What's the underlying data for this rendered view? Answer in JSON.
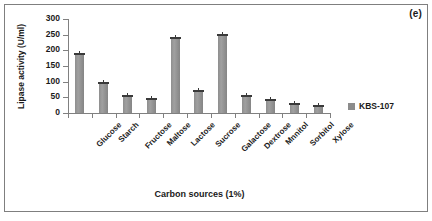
{
  "figure": {
    "panel_letter": "(e)",
    "background_color": "#ffffff",
    "frame_color": "#7f7f7f"
  },
  "legend": {
    "position": "right",
    "entries": [
      {
        "label": "KBS-107",
        "color": "#8c8c8c"
      }
    ]
  },
  "chart_data": {
    "type": "bar",
    "title": "(e)",
    "xlabel": "Carbon sources (1%)",
    "ylabel": "Lipase activity (U/ml)",
    "ylim": [
      0,
      300
    ],
    "ytick_step": 50,
    "yticks": [
      300,
      250,
      200,
      150,
      100,
      50,
      0
    ],
    "grid": false,
    "legend_position": "right",
    "bar_color": "#8c8c8c",
    "error_bars": true,
    "categories": [
      "Glucose",
      "Starch",
      "Fructose",
      "Maltose",
      "Lactose",
      "Sucrose",
      "Galactose",
      "Dextrose",
      "Mnnitol",
      "Sorbitol",
      "Xylose"
    ],
    "series": [
      {
        "name": "KBS-107",
        "values": [
          185,
          93,
          50,
          43,
          235,
          67,
          245,
          52,
          38,
          26,
          20
        ],
        "errors": [
          5,
          4,
          3,
          3,
          5,
          3,
          5,
          3,
          3,
          2,
          2
        ]
      }
    ]
  }
}
